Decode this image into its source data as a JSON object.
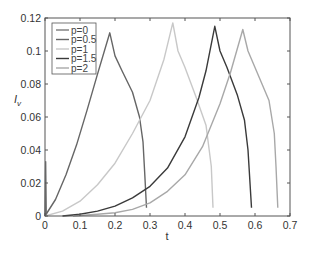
{
  "chart_data": {
    "type": "line",
    "title": "",
    "xlabel": "t",
    "ylabel": "I_v",
    "xlim": [
      0,
      0.7
    ],
    "ylim": [
      0,
      0.12
    ],
    "xticks": [
      "0",
      "0.1",
      "0.2",
      "0.3",
      "0.4",
      "0.5",
      "0.6",
      "0.7"
    ],
    "yticks": [
      "0",
      "0.02",
      "0.04",
      "0.06",
      "0.08",
      "0.1",
      "0.12"
    ],
    "grid": false,
    "legend_position": "upper-left",
    "series": [
      {
        "name": "p=0",
        "color": "#7a7a7a",
        "points": [
          [
            0,
            0
          ],
          [
            0.002,
            0.033
          ],
          [
            0.004,
            0.0
          ]
        ]
      },
      {
        "name": "p=0.5",
        "color": "#666666",
        "points": [
          [
            0,
            0
          ],
          [
            0.03,
            0.01
          ],
          [
            0.06,
            0.025
          ],
          [
            0.09,
            0.043
          ],
          [
            0.12,
            0.064
          ],
          [
            0.15,
            0.086
          ],
          [
            0.185,
            0.111
          ],
          [
            0.2,
            0.097
          ],
          [
            0.22,
            0.088
          ],
          [
            0.25,
            0.075
          ],
          [
            0.27,
            0.06
          ],
          [
            0.28,
            0.045
          ],
          [
            0.285,
            0.025
          ],
          [
            0.29,
            0.005
          ]
        ]
      },
      {
        "name": "p=1",
        "color": "#c8c8c8",
        "points": [
          [
            0,
            0
          ],
          [
            0.05,
            0.003
          ],
          [
            0.1,
            0.009
          ],
          [
            0.15,
            0.019
          ],
          [
            0.2,
            0.032
          ],
          [
            0.25,
            0.05
          ],
          [
            0.3,
            0.07
          ],
          [
            0.34,
            0.095
          ],
          [
            0.365,
            0.117
          ],
          [
            0.38,
            0.1
          ],
          [
            0.4,
            0.09
          ],
          [
            0.43,
            0.073
          ],
          [
            0.46,
            0.055
          ],
          [
            0.475,
            0.03
          ],
          [
            0.48,
            0.005
          ]
        ]
      },
      {
        "name": "p=1.5",
        "color": "#3a3a3a",
        "points": [
          [
            0.05,
            0
          ],
          [
            0.1,
            0.001
          ],
          [
            0.15,
            0.003
          ],
          [
            0.2,
            0.006
          ],
          [
            0.25,
            0.011
          ],
          [
            0.3,
            0.018
          ],
          [
            0.35,
            0.029
          ],
          [
            0.4,
            0.048
          ],
          [
            0.44,
            0.072
          ],
          [
            0.46,
            0.088
          ],
          [
            0.485,
            0.115
          ],
          [
            0.5,
            0.1
          ],
          [
            0.52,
            0.09
          ],
          [
            0.55,
            0.073
          ],
          [
            0.57,
            0.058
          ],
          [
            0.58,
            0.04
          ],
          [
            0.59,
            0.005
          ]
        ]
      },
      {
        "name": "p=2",
        "color": "#a8a8a8",
        "points": [
          [
            0.08,
            0
          ],
          [
            0.15,
            0.001
          ],
          [
            0.2,
            0.002
          ],
          [
            0.25,
            0.004
          ],
          [
            0.3,
            0.008
          ],
          [
            0.35,
            0.015
          ],
          [
            0.4,
            0.025
          ],
          [
            0.45,
            0.042
          ],
          [
            0.5,
            0.068
          ],
          [
            0.53,
            0.087
          ],
          [
            0.565,
            0.113
          ],
          [
            0.58,
            0.1
          ],
          [
            0.6,
            0.09
          ],
          [
            0.62,
            0.08
          ],
          [
            0.64,
            0.07
          ],
          [
            0.655,
            0.05
          ],
          [
            0.66,
            0.03
          ],
          [
            0.665,
            0.005
          ]
        ]
      }
    ]
  },
  "legend": {
    "entries": [
      {
        "label": "p=0",
        "color": "#7a7a7a"
      },
      {
        "label": "p=0.5",
        "color": "#666666"
      },
      {
        "label": "p=1",
        "color": "#c8c8c8"
      },
      {
        "label": "p=1.5",
        "color": "#3a3a3a"
      },
      {
        "label": "p=2",
        "color": "#a8a8a8"
      }
    ]
  },
  "axes": {
    "xlabel": "t",
    "ylabel_main": "I",
    "ylabel_sub": "v"
  }
}
